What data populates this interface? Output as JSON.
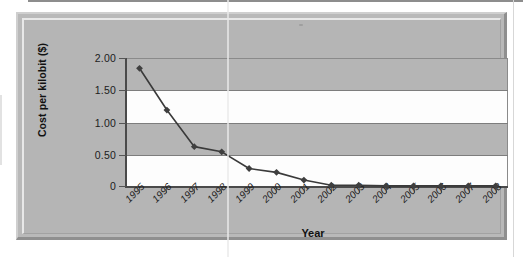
{
  "chart_data": {
    "type": "line",
    "title": "",
    "xlabel": "Year",
    "ylabel": "Cost per kilobit ($)",
    "categories": [
      "1995",
      "1996",
      "1997",
      "1998",
      "1999",
      "2000",
      "2001",
      "2002",
      "2003",
      "2004",
      "2005",
      "2006",
      "2007",
      "2008"
    ],
    "values": [
      1.84,
      1.19,
      0.62,
      0.54,
      0.28,
      0.22,
      0.1,
      0.02,
      0.02,
      0.01,
      0.01,
      0.01,
      0.01,
      0.01
    ],
    "series": [
      {
        "name": "Cost per kilobit ($)",
        "values": [
          1.84,
          1.19,
          0.62,
          0.54,
          0.28,
          0.22,
          0.1,
          0.02,
          0.02,
          0.01,
          0.01,
          0.01,
          0.01,
          0.01
        ]
      }
    ],
    "ylim": [
      0,
      2.0
    ],
    "ytick_labels": [
      "2.00",
      "1.50",
      "1.00",
      "0.50",
      "0"
    ],
    "ytick_values": [
      2.0,
      1.5,
      1.0,
      0.5,
      0
    ],
    "grid": true,
    "legend": false,
    "legend_position": "none",
    "marker": "diamond",
    "line_color": "#3a3a3a",
    "marker_color": "#3f3f3f",
    "plot_band_colors": [
      "#b5b5b5",
      "#fdfdfd"
    ],
    "frame_color": "#b9b9b9"
  },
  "axis": {
    "y_title": "Cost per kilobit ($)",
    "x_title": "Year",
    "y_labels": [
      "2.00",
      "1.50",
      "1.00",
      "0.50",
      "0"
    ],
    "x_labels": [
      "1995",
      "1996",
      "1997",
      "1998",
      "1999",
      "2000",
      "2001",
      "2002",
      "2003",
      "2004",
      "2005",
      "2006",
      "2007",
      "2008"
    ]
  }
}
